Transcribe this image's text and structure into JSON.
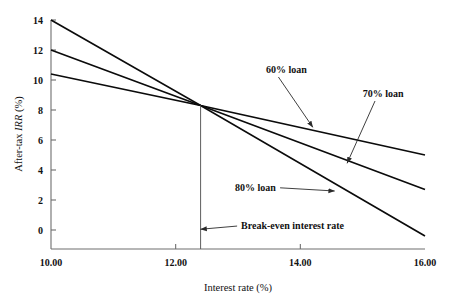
{
  "chart_data": {
    "type": "line",
    "title": "",
    "xlabel": "Interest rate (%)",
    "ylabel": "After-tax IRR (%)",
    "ylabel_prefix": "After-tax ",
    "ylabel_italic": "IRR",
    "ylabel_suffix": " (%)",
    "xlim": [
      10.0,
      16.0
    ],
    "ylim": [
      -1.2,
      14.0
    ],
    "grid": false,
    "legend": "none (inline annotations with leader lines)",
    "xticks": [
      10.0,
      12.0,
      14.0,
      16.0
    ],
    "xticklabels": [
      "10.00",
      "12.00",
      "14.00",
      "16.00"
    ],
    "yticks": [
      0,
      2,
      4,
      6,
      8,
      10,
      12,
      14
    ],
    "yticklabels": [
      "0",
      "2",
      "4",
      "6",
      "8",
      "10",
      "12",
      "14"
    ],
    "series": [
      {
        "name": "60% loan",
        "x": [
          10.0,
          12.4,
          16.0
        ],
        "y": [
          14.0,
          8.3,
          5.0
        ]
      },
      {
        "name": "70% loan",
        "x": [
          10.0,
          12.4,
          16.0
        ],
        "y": [
          12.0,
          8.3,
          2.7
        ]
      },
      {
        "name": "80% loan",
        "x": [
          10.0,
          12.4,
          16.0
        ],
        "y": [
          10.4,
          8.3,
          -0.4
        ]
      }
    ],
    "annotations": [
      {
        "name": "loan-60-label",
        "text": "60% loan",
        "label_x": 13.45,
        "label_y": 10.5,
        "target_x": 14.2,
        "target_y": 6.85
      },
      {
        "name": "loan-70-label",
        "text": "70% loan",
        "label_x": 15.0,
        "label_y": 8.9,
        "target_x": 14.75,
        "target_y": 4.45
      },
      {
        "name": "loan-80-label",
        "text": "80% loan",
        "label_x": 12.95,
        "label_y": 2.6,
        "target_x": 14.55,
        "target_y": 2.6
      },
      {
        "name": "break-even-label",
        "text": "Break-even interest rate",
        "label_x": 13.05,
        "label_y": 0.05,
        "target_x": 12.4,
        "target_y": 0.05
      }
    ],
    "breakeven": {
      "interest_rate": 12.4,
      "irr": 8.3,
      "vertical_line_from_y": 8.3,
      "vertical_line_to_y": -1.2
    },
    "colors": {
      "line": "#0b0b0b",
      "axis": "#6e6e6e",
      "text": "#111111",
      "background": "#ffffff"
    }
  }
}
